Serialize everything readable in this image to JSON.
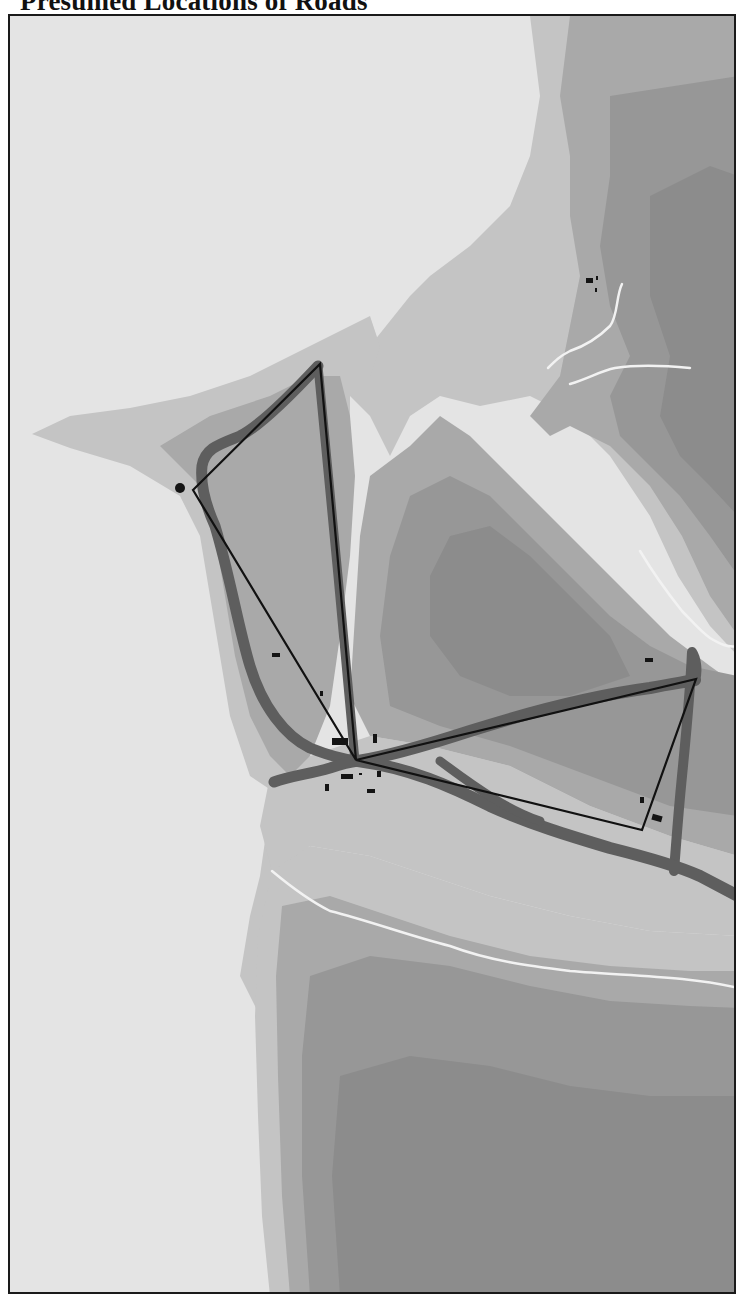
{
  "title": "Presumed Locations of Roads",
  "map": {
    "colors": {
      "lowland": "#e4e4e4",
      "elevation_1": "#c4c4c4",
      "elevation_2": "#a9a9a9",
      "elevation_3": "#979797",
      "elevation_4": "#8c8c8c",
      "presumed_road": "#5e5e5e",
      "straight_route": "#111111",
      "stream": "#f2f2f2",
      "building": "#141414"
    },
    "features": {
      "presumed_roads": [
        "north-loop-road",
        "west-road",
        "central-hub-road",
        "east-loop-road",
        "southeast-road"
      ],
      "straight_routes": [
        "northern-triangle",
        "eastern-triangle"
      ],
      "streams": [
        "northeast-stream",
        "east-valley-stream",
        "southern-stream"
      ],
      "settlements": [
        "west-marker",
        "central-hub-cluster",
        "northeast-cluster",
        "east-cluster"
      ]
    }
  }
}
